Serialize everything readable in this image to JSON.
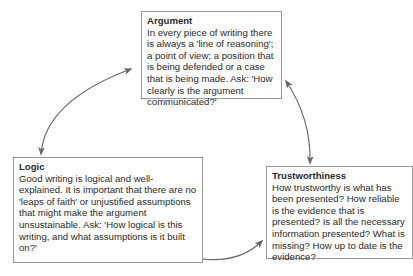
{
  "diagram": {
    "type": "cycle",
    "nodes": [
      {
        "id": "argument",
        "title": "Argument",
        "body": "In every piece of writing there is always a 'line of reasoning'; a point of view; a position that is being defended or a case that is being made. Ask: 'How clearly is the argument communicated?'"
      },
      {
        "id": "logic",
        "title": "Logic",
        "body": "Good writing is logical and well-explained. It is important that there are no 'leaps of faith' or unjustified assumptions that might make the argument unsustainable. Ask: 'How logical is this writing, and what assumptions is it built on?'"
      },
      {
        "id": "trustworthiness",
        "title": "Trustworthiness",
        "body": "How trustworthy is what has been presented? How reliable is the evidence that is presented? Is all the necessary information presented? What is missing? How up to date is the evidence?"
      }
    ],
    "edges": [
      {
        "from": "logic",
        "to": "argument",
        "bidirectional": true
      },
      {
        "from": "argument",
        "to": "trustworthiness",
        "bidirectional": true
      },
      {
        "from": "trustworthiness",
        "to": "logic",
        "bidirectional": true
      }
    ],
    "colors": {
      "arrow": "#6b6b6b",
      "border": "#9a9a9a",
      "text": "#2a2a2a"
    }
  }
}
